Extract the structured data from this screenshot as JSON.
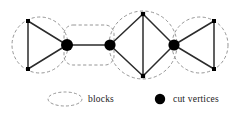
{
  "figure": {
    "caption_absent": true,
    "background_color": "#ffffff",
    "stroke_color": "#2b2b2b",
    "dash_color": "#8a8a8a",
    "node_fill": "#000000",
    "width": 243,
    "height": 113
  },
  "graph": {
    "description": "Graph illustrating blocks (biconnected components) and cut vertices",
    "cut_vertices": [
      {
        "id": "c1",
        "x": 67,
        "y": 45,
        "r": 6.0
      },
      {
        "id": "c2",
        "x": 110,
        "y": 45,
        "r": 5.6
      },
      {
        "id": "c3",
        "x": 174,
        "y": 45,
        "r": 5.6
      }
    ],
    "plain_vertices": [
      {
        "id": "v1",
        "x": 28,
        "y": 21,
        "size": 4.0
      },
      {
        "id": "v2",
        "x": 28,
        "y": 69,
        "size": 4.0
      },
      {
        "id": "v3",
        "x": 143,
        "y": 14,
        "size": 4.2
      },
      {
        "id": "v4",
        "x": 143,
        "y": 76,
        "size": 4.2
      },
      {
        "id": "v5",
        "x": 214,
        "y": 21,
        "size": 4.0
      },
      {
        "id": "v6",
        "x": 214,
        "y": 69,
        "size": 4.0
      }
    ],
    "edges": [
      {
        "from": "v1",
        "to": "v2"
      },
      {
        "from": "v1",
        "to": "c1"
      },
      {
        "from": "v2",
        "to": "c1"
      },
      {
        "from": "c1",
        "to": "c2"
      },
      {
        "from": "c2",
        "to": "v3"
      },
      {
        "from": "c2",
        "to": "v4"
      },
      {
        "from": "v3",
        "to": "v4"
      },
      {
        "from": "v3",
        "to": "c3"
      },
      {
        "from": "v4",
        "to": "c3"
      },
      {
        "from": "c3",
        "to": "v5"
      },
      {
        "from": "c3",
        "to": "v6"
      },
      {
        "from": "v5",
        "to": "v6"
      }
    ],
    "blocks": [
      {
        "id": "b1",
        "shape": "circle",
        "cx": 40,
        "cy": 45,
        "r": 28
      },
      {
        "id": "b2",
        "shape": "rounded-rect",
        "x": 64,
        "y": 25,
        "w": 50,
        "h": 40,
        "rx": 9
      },
      {
        "id": "b3",
        "shape": "circle",
        "cx": 143,
        "cy": 45,
        "r": 34
      },
      {
        "id": "b4",
        "shape": "circle",
        "cx": 200,
        "cy": 45,
        "r": 28
      }
    ]
  },
  "legend": {
    "items": [
      {
        "symbol": "dashed-ellipse",
        "label": "blocks",
        "symbol_cx": 65,
        "symbol_cy": 99,
        "symbol_rx": 17,
        "symbol_ry": 7,
        "label_x": 88,
        "label_y": 102
      },
      {
        "symbol": "filled-dot",
        "label": "cut vertices",
        "symbol_cx": 160,
        "symbol_cy": 99,
        "symbol_r": 5.2,
        "label_x": 173,
        "label_y": 102
      }
    ]
  }
}
